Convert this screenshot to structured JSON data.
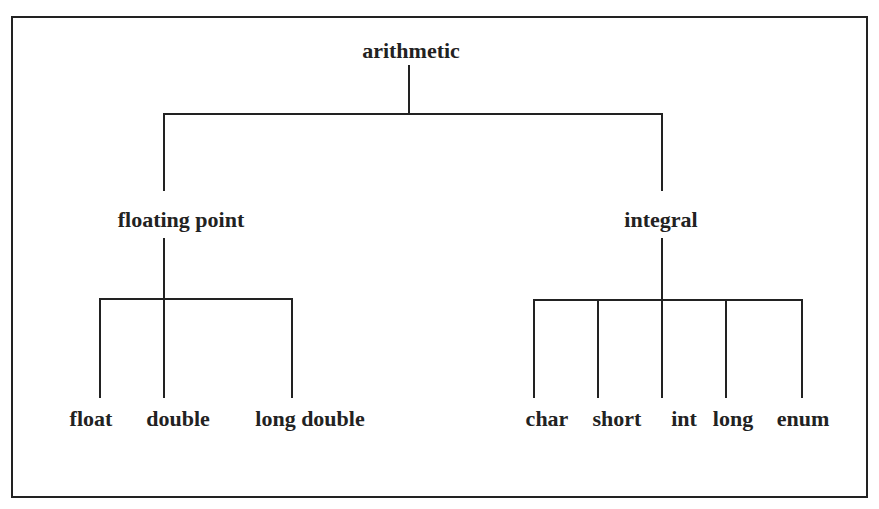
{
  "diagram": {
    "root": {
      "label": "arithmetic"
    },
    "branches": [
      {
        "label": "floating point",
        "children": [
          "float",
          "double",
          "long double"
        ]
      },
      {
        "label": "integral",
        "children": [
          "char",
          "short",
          "int",
          "long",
          "enum"
        ]
      }
    ]
  }
}
